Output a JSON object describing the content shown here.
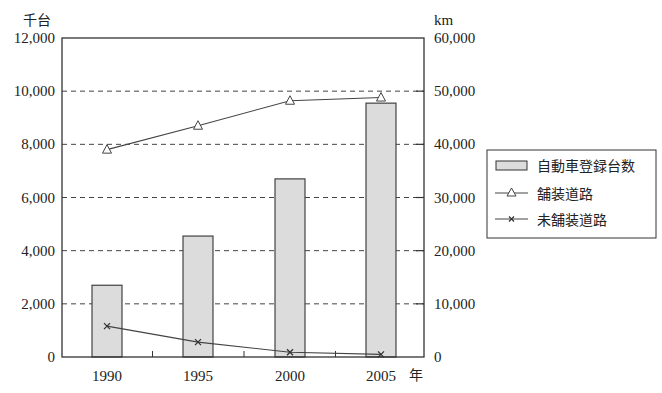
{
  "chart_data": {
    "type": "bar+line",
    "title": "",
    "categories": [
      "1990",
      "1995",
      "2000",
      "2005"
    ],
    "xlabel": "年",
    "ylabel_left": "千台",
    "ylabel_right": "km",
    "ylim_left": [
      0,
      12000
    ],
    "ylim_right": [
      0,
      60000
    ],
    "yticks_left": [
      "0",
      "2,000",
      "4,000",
      "6,000",
      "8,000",
      "10,000",
      "12,000"
    ],
    "yticks_right": [
      "0",
      "10,000",
      "20,000",
      "30,000",
      "40,000",
      "50,000",
      "60,000"
    ],
    "grid": "horizontal dashed",
    "legend_position": "right",
    "series": [
      {
        "name": "自動車登録台数",
        "type": "bar",
        "axis": "left",
        "unit": "千台",
        "values": [
          2700,
          4550,
          6700,
          9550
        ],
        "color": "#dcdcdc"
      },
      {
        "name": "舗装道路",
        "type": "line",
        "marker": "triangle",
        "axis": "right",
        "unit": "km",
        "values": [
          39000,
          43500,
          48200,
          48800
        ],
        "color": "#444444"
      },
      {
        "name": "未舗装道路",
        "type": "line",
        "marker": "x",
        "axis": "right",
        "unit": "km",
        "values": [
          5800,
          2800,
          900,
          500
        ],
        "color": "#444444"
      }
    ]
  }
}
